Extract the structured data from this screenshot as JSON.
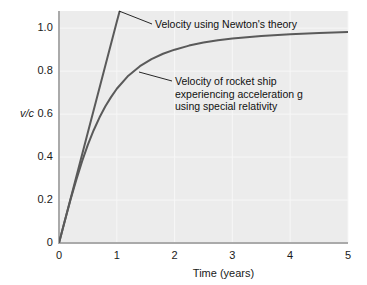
{
  "chart_data": {
    "type": "line",
    "title": "",
    "xlabel": "Time (years)",
    "ylabel": "v/c",
    "xlim": [
      0,
      5
    ],
    "ylim": [
      0,
      1.08
    ],
    "grid": true,
    "legend_position": "none",
    "xticks": [
      "0",
      "1",
      "2",
      "3",
      "4",
      "5"
    ],
    "xtick_values": [
      0,
      1,
      2,
      3,
      4,
      5
    ],
    "yticks": [
      "0",
      "0.2",
      "0.4",
      "0.6",
      "0.8",
      "1.0"
    ],
    "ytick_values": [
      0,
      0.2,
      0.4,
      0.6,
      0.8,
      1.0
    ],
    "series": [
      {
        "name": "Velocity using Newton's theory",
        "color": "#5a5a5a",
        "x": [
          0,
          0.25,
          0.5,
          0.75,
          1.0,
          1.05
        ],
        "values": [
          0,
          0.2575,
          0.515,
          0.7725,
          1.03,
          1.08
        ]
      },
      {
        "name": "Velocity of rocket ship experiencing acceleration g using special relativity",
        "color": "#5a5a5a",
        "x": [
          0,
          0.1,
          0.2,
          0.3,
          0.4,
          0.5,
          0.6,
          0.7,
          0.8,
          0.9,
          1.0,
          1.2,
          1.4,
          1.6,
          1.8,
          2.0,
          2.25,
          2.5,
          2.75,
          3.0,
          3.5,
          4.0,
          4.5,
          5.0
        ],
        "values": [
          0,
          0.102,
          0.202,
          0.295,
          0.381,
          0.458,
          0.525,
          0.584,
          0.635,
          0.679,
          0.718,
          0.779,
          0.823,
          0.856,
          0.881,
          0.9,
          0.919,
          0.933,
          0.944,
          0.952,
          0.964,
          0.972,
          0.978,
          0.982
        ]
      }
    ],
    "annotations": [
      {
        "id": "newton-annotation",
        "lines": [
          "Velocity using Newton's theory"
        ],
        "text_x": 155,
        "text_y": 18,
        "leader": {
          "x1": 152,
          "y1": 24,
          "x2": 119,
          "y2": 11
        }
      },
      {
        "id": "relativity-annotation",
        "lines": [
          "Velocity of rocket ship",
          "experiencing acceleration g",
          "using special relativity"
        ],
        "text_x": 175,
        "text_y": 75,
        "leader": {
          "x1": 172,
          "y1": 81,
          "x2": 139,
          "y2": 72
        }
      }
    ],
    "colors": {
      "plot_background": "#ececec",
      "gridline": "#f7f7f7",
      "axis": "#aaaaaa",
      "curve": "#5a5a5a",
      "page_background": "#ffffff",
      "text": "#111111"
    },
    "axes_geometry": {
      "left": 59,
      "right": 348,
      "top": 11,
      "bottom": 243
    }
  }
}
